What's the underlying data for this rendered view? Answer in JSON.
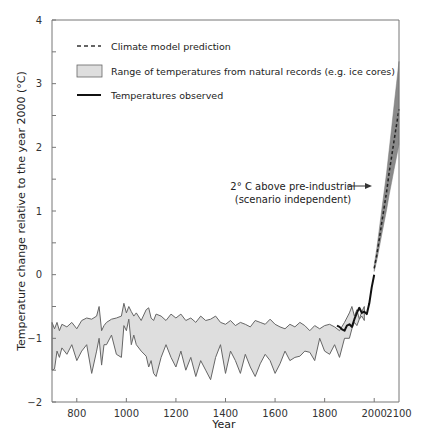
{
  "chart_data": {
    "type": "line",
    "title": "",
    "xlabel": "Year",
    "ylabel": "Temperature change relative to the year 2000 (°C)",
    "xlim": [
      700,
      2100
    ],
    "ylim": [
      -2,
      4
    ],
    "grid": false,
    "legend_position": "upper-left",
    "x_ticks": [
      800,
      1000,
      1200,
      1400,
      1600,
      1800,
      2000,
      2100
    ],
    "x_tick_labels": [
      "800",
      "1000",
      "1200",
      "1400",
      "1600",
      "1800",
      "2000",
      "2100"
    ],
    "y_ticks": [
      -2,
      -1,
      0,
      1,
      2,
      3,
      4
    ],
    "y_tick_labels": [
      "−2",
      "−1",
      "0",
      "1",
      "2",
      "3",
      "4"
    ],
    "y_minor_ticks": [
      -1.5,
      -0.5,
      0.5,
      1.5,
      2.5,
      3.5
    ],
    "legend": [
      {
        "label": "Climate model prediction",
        "style": "dashed"
      },
      {
        "label": "Range of temperatures from natural records (e.g. ice cores)",
        "style": "band"
      },
      {
        "label": "Temperatures observed",
        "style": "solid"
      }
    ],
    "annotations": [
      {
        "text_lines": [
          "2° C above pre-industrial",
          "(scenario independent)"
        ],
        "arrow_to": [
          2075,
          2.0
        ]
      }
    ],
    "series": [
      {
        "name": "Range of temperatures from natural records (e.g. ice cores)",
        "kind": "band",
        "x": [
          700,
          710,
          720,
          730,
          740,
          760,
          780,
          800,
          820,
          840,
          860,
          880,
          890,
          900,
          910,
          920,
          940,
          960,
          980,
          990,
          1000,
          1010,
          1020,
          1030,
          1040,
          1060,
          1080,
          1090,
          1100,
          1110,
          1120,
          1140,
          1160,
          1180,
          1200,
          1220,
          1240,
          1260,
          1280,
          1300,
          1320,
          1340,
          1360,
          1380,
          1400,
          1420,
          1440,
          1460,
          1480,
          1500,
          1520,
          1540,
          1560,
          1580,
          1600,
          1620,
          1640,
          1660,
          1680,
          1700,
          1720,
          1740,
          1760,
          1780,
          1800,
          1820,
          1840,
          1860,
          1880,
          1900,
          1910,
          1920,
          1930,
          1940,
          1950,
          1960
        ],
        "upper": [
          -0.75,
          -0.85,
          -0.75,
          -0.88,
          -0.78,
          -0.82,
          -0.75,
          -0.85,
          -0.72,
          -0.68,
          -0.7,
          -0.65,
          -0.5,
          -0.88,
          -0.8,
          -0.75,
          -0.7,
          -0.68,
          -0.65,
          -0.45,
          -0.6,
          -0.5,
          -0.58,
          -0.65,
          -0.6,
          -0.72,
          -0.55,
          -0.52,
          -0.68,
          -0.72,
          -0.62,
          -0.65,
          -0.72,
          -0.62,
          -0.68,
          -0.62,
          -0.72,
          -0.68,
          -0.75,
          -0.65,
          -0.72,
          -0.7,
          -0.65,
          -0.75,
          -0.78,
          -0.72,
          -0.8,
          -0.75,
          -0.78,
          -0.82,
          -0.72,
          -0.75,
          -0.78,
          -0.7,
          -0.78,
          -0.82,
          -0.85,
          -0.78,
          -0.82,
          -0.75,
          -0.8,
          -0.88,
          -0.8,
          -0.85,
          -0.8,
          -0.78,
          -0.82,
          -0.88,
          -0.75,
          -0.6,
          -0.5,
          -0.65,
          -0.55,
          -0.7,
          -0.58,
          -0.5
        ],
        "lower": [
          -1.5,
          -1.48,
          -1.2,
          -1.3,
          -1.15,
          -1.25,
          -1.1,
          -1.35,
          -1.2,
          -1.1,
          -1.55,
          -1.2,
          -1.0,
          -1.42,
          -1.1,
          -1.1,
          -0.95,
          -1.25,
          -1.3,
          -0.8,
          -0.88,
          -0.7,
          -1.1,
          -0.95,
          -1.1,
          -1.2,
          -1.28,
          -1.45,
          -1.35,
          -1.55,
          -1.6,
          -1.3,
          -1.1,
          -1.3,
          -1.45,
          -1.2,
          -1.5,
          -1.3,
          -1.6,
          -1.35,
          -1.5,
          -1.65,
          -1.3,
          -1.1,
          -1.55,
          -1.2,
          -1.35,
          -1.55,
          -1.25,
          -1.45,
          -1.6,
          -1.4,
          -1.25,
          -1.35,
          -1.55,
          -1.4,
          -1.2,
          -1.35,
          -1.3,
          -1.28,
          -1.2,
          -1.22,
          -1.35,
          -1.0,
          -1.2,
          -1.25,
          -1.1,
          -1.3,
          -1.0,
          -1.0,
          -0.85,
          -0.75,
          -0.8,
          -0.7,
          -0.65,
          -0.72
        ]
      },
      {
        "name": "Temperatures observed",
        "kind": "line",
        "x": [
          1850,
          1860,
          1870,
          1880,
          1890,
          1900,
          1910,
          1920,
          1930,
          1940,
          1950,
          1960,
          1970,
          1980,
          1990,
          2000
        ],
        "y": [
          -0.8,
          -0.82,
          -0.86,
          -0.88,
          -0.8,
          -0.78,
          -0.82,
          -0.7,
          -0.6,
          -0.52,
          -0.6,
          -0.58,
          -0.62,
          -0.45,
          -0.2,
          0.0
        ]
      },
      {
        "name": "Climate model prediction",
        "kind": "dashed-line",
        "x": [
          2000,
          2010,
          2020,
          2030,
          2040,
          2050,
          2060,
          2070,
          2080,
          2090,
          2100
        ],
        "y": [
          0.1,
          0.3,
          0.55,
          0.8,
          1.05,
          1.3,
          1.6,
          1.85,
          2.1,
          2.35,
          2.6
        ]
      },
      {
        "name": "Climate model prediction range",
        "kind": "band",
        "x": [
          2000,
          2010,
          2020,
          2030,
          2040,
          2050,
          2060,
          2070,
          2080,
          2090,
          2100
        ],
        "upper": [
          0.15,
          0.4,
          0.7,
          1.0,
          1.3,
          1.6,
          1.95,
          2.3,
          2.65,
          3.0,
          3.35
        ],
        "lower": [
          0.05,
          0.22,
          0.42,
          0.62,
          0.82,
          1.02,
          1.25,
          1.45,
          1.65,
          1.85,
          2.05
        ]
      }
    ]
  }
}
